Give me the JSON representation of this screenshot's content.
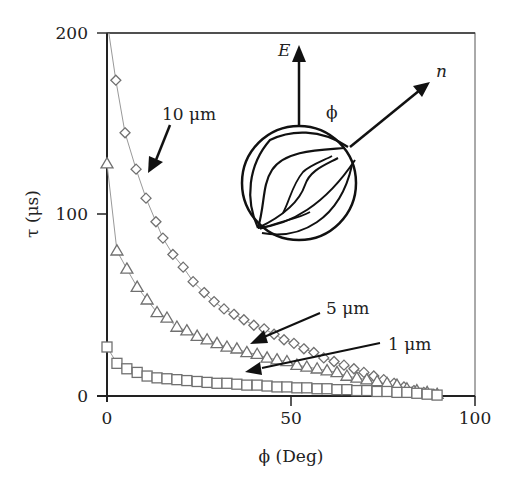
{
  "chart_data": {
    "type": "scatter",
    "title": "",
    "xlabel": "ϕ (Deg)",
    "ylabel": "τ (μs)",
    "xlim": [
      0,
      100
    ],
    "ylim": [
      0,
      200
    ],
    "xticks": [
      0,
      50,
      100
    ],
    "yticks": [
      0,
      100,
      200
    ],
    "grid": false,
    "legend": "none (arrow annotations)",
    "series": [
      {
        "name": "10 μm",
        "marker": "diamond",
        "x": [
          2.4,
          4.9,
          7.9,
          10.6,
          13.3,
          15.2,
          17.9,
          20.7,
          23.4,
          26.4,
          29.1,
          31.8,
          34.5,
          37.2,
          39.9,
          42.7,
          45.4,
          48.1,
          50.8,
          53.5,
          56.2,
          58.9,
          61.7,
          64.4,
          67.1,
          69.8,
          72.5,
          75.2,
          78.0,
          80.7,
          83.4,
          86.1,
          88.8
        ],
        "y": [
          174,
          145,
          125,
          109,
          96,
          87,
          78,
          71,
          63,
          57,
          52,
          48,
          45,
          42,
          39,
          37,
          34,
          31,
          29,
          26,
          24,
          21,
          19,
          17,
          15,
          13,
          11,
          9,
          7,
          5,
          3,
          2,
          1
        ]
      },
      {
        "name": "5 μm",
        "marker": "triangle",
        "x": [
          0,
          2.7,
          5.4,
          8.2,
          10.9,
          13.6,
          16.3,
          19.0,
          21.7,
          24.5,
          27.2,
          29.9,
          32.6,
          35.3,
          38.0,
          40.8,
          43.5,
          46.2,
          48.9,
          51.6,
          54.3,
          57.1,
          59.8,
          62.5,
          65.2,
          67.9,
          70.6,
          73.4,
          76.1,
          78.8,
          81.5,
          84.2,
          87.0,
          89.7
        ],
        "y": [
          128,
          80,
          70,
          60,
          53,
          46,
          43,
          38,
          36,
          33,
          31,
          29,
          27,
          26,
          24,
          23,
          21,
          20,
          19,
          17,
          16,
          15,
          14,
          13,
          11,
          10,
          9,
          8,
          7,
          6,
          4,
          3,
          2,
          1
        ]
      },
      {
        "name": "1 μm",
        "marker": "square",
        "x": [
          0,
          2.7,
          5.4,
          8.2,
          10.9,
          13.6,
          16.3,
          19.0,
          21.7,
          24.5,
          27.2,
          29.9,
          32.6,
          35.3,
          38.0,
          40.8,
          43.5,
          46.2,
          48.9,
          51.6,
          54.3,
          57.1,
          59.8,
          62.5,
          65.2,
          67.9,
          70.6,
          73.4,
          76.1,
          78.8,
          81.5,
          84.2,
          87.0,
          89.7
        ],
        "y": [
          27,
          18,
          15,
          13,
          11,
          10,
          9.5,
          9,
          8.5,
          8,
          7.5,
          7,
          7,
          6.5,
          6,
          6,
          5.5,
          5,
          5,
          4.5,
          4.5,
          4,
          4,
          3.5,
          3.5,
          3,
          3,
          2.5,
          2.5,
          2,
          2,
          1.5,
          1,
          0.5
        ]
      }
    ],
    "annotations": {
      "label_10um": "10 μm",
      "label_5um": "5 μm",
      "label_1um": "1 μm",
      "inset_E": "E",
      "inset_n": "n",
      "inset_phi": "ϕ"
    }
  },
  "axes": {
    "x_title": "ϕ (Deg)",
    "y_title": "τ (μs)",
    "x_tick_labels": [
      "0",
      "50",
      "100"
    ],
    "y_tick_labels": [
      "0",
      "100",
      "200"
    ]
  },
  "style": {
    "marker_stroke": "#707070",
    "line_color": "#999999",
    "axis_color": "#222222"
  }
}
